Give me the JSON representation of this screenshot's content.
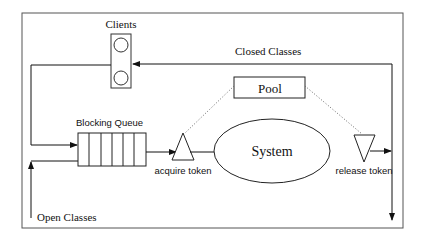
{
  "diagram": {
    "labels": {
      "clients": "Clients",
      "closed_classes": "Closed Classes",
      "pool": "Pool",
      "blocking_queue": "Blocking Queue",
      "system": "System",
      "acquire_token": "acquire token",
      "release_token": "release token",
      "open_classes": "Open Classes"
    },
    "queue_cells": 6,
    "colors": {
      "stroke": "#222222",
      "frame": "#555555",
      "background": "#ffffff"
    }
  }
}
